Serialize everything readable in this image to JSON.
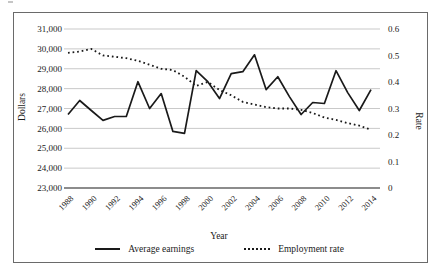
{
  "axis_titles": {
    "left": "Dollars",
    "right": "Rate",
    "bottom": "Year"
  },
  "legend": {
    "items": [
      {
        "label": "Average earnings",
        "style": "solid"
      },
      {
        "label": "Employment rate",
        "style": "dotted"
      }
    ]
  },
  "colors": {
    "line": "#1a1a1a",
    "grid": "#c9c9c9",
    "axis_line": "#8c8c8c",
    "frame_border": "#6a6a6a",
    "text": "#1a1a1a",
    "background": "#ffffff"
  },
  "chart_data": {
    "type": "line",
    "xlabel": "Year",
    "grid": true,
    "legend_position": "bottom",
    "x": [
      1988,
      1989,
      1990,
      1991,
      1992,
      1993,
      1994,
      1995,
      1996,
      1997,
      1998,
      1999,
      2000,
      2001,
      2002,
      2003,
      2004,
      2005,
      2006,
      2007,
      2008,
      2009,
      2010,
      2011,
      2012,
      2013,
      2014
    ],
    "x_tick_labels": [
      "1988",
      "1990",
      "1992",
      "1994",
      "1996",
      "1998",
      "2000",
      "2002",
      "2004",
      "2006",
      "2008",
      "2010",
      "2012",
      "2014"
    ],
    "left_axis": {
      "label": "Dollars",
      "min": 23000,
      "max": 31000,
      "tick_step": 1000,
      "tick_labels": [
        "31,000",
        "30,000",
        "29,000",
        "28,000",
        "27,000",
        "26,000",
        "25,000",
        "24,000",
        "23,000"
      ]
    },
    "right_axis": {
      "label": "Rate",
      "min": 0,
      "max": 0.6,
      "tick_step": 0.1,
      "tick_labels": [
        "0.6",
        "0.5",
        "0.4",
        "0.3",
        "0.2",
        "0.1",
        "0"
      ]
    },
    "series": [
      {
        "name": "Average earnings",
        "axis": "left",
        "line_style": "solid",
        "values": [
          26700,
          27400,
          26900,
          26400,
          26600,
          26600,
          28350,
          27000,
          27750,
          25850,
          25750,
          28900,
          28350,
          27500,
          28750,
          28850,
          29700,
          27950,
          28600,
          27600,
          26700,
          27300,
          27250,
          28900,
          27800,
          26900,
          27950
        ]
      },
      {
        "name": "Employment rate",
        "axis": "right",
        "line_style": "dotted",
        "values": [
          0.51,
          0.515,
          0.525,
          0.5,
          0.495,
          0.49,
          0.48,
          0.465,
          0.45,
          0.445,
          0.42,
          0.385,
          0.4,
          0.37,
          0.35,
          0.325,
          0.315,
          0.305,
          0.3,
          0.3,
          0.295,
          0.283,
          0.266,
          0.257,
          0.245,
          0.235,
          0.22
        ]
      }
    ]
  }
}
